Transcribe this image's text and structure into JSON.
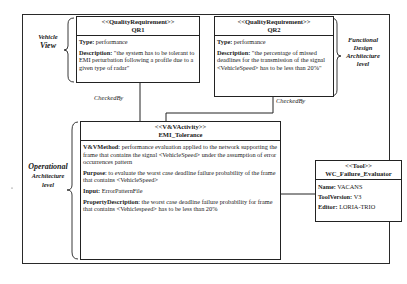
{
  "levels": {
    "vehicle": [
      "Vehicle",
      "View"
    ],
    "functional": [
      "Functional",
      "Design",
      "Architecture",
      "level"
    ],
    "operational": [
      "Operational",
      "Architecture",
      "level"
    ]
  },
  "qr1": {
    "stereotype": "<<QualityRequirement>>",
    "name": "QR1",
    "type_label": "Type:",
    "type_value": " performance",
    "desc_label": "Description:",
    "desc_value": " \"the system has to be tolerant to EMI perturbation following a profile due to a given type of radar\""
  },
  "qr2": {
    "stereotype": "<<QualityRequirement>>",
    "name": "QR2",
    "type_label": "Type:",
    "type_value": " performance",
    "desc_label": "Description:",
    "desc_value": " \"the percentage of missed deadlines for the transmission of the signal <VehicleSpeed> has to be less than 20%\""
  },
  "activity": {
    "stereotype": "<<V&VActivity>>",
    "name": "EMI_Tolerance",
    "method_label": "V&VMethod",
    "method_value": ": performance evaluation applied to the network supporting  the frame that contains the signal <VehicleSpeed>  under the assumption of error occurrences pattern",
    "purpose_label": "Purpose",
    "purpose_value": ": to evaluate the worst case deadline failure probability of the frame that contains <VehicleSpeed>",
    "input_label": "Input:",
    "input_value": " ErrorPatternFile",
    "prop_label": "PropertyDescription",
    "prop_value": ": the worst case deadline failure probability for frame that contains <Vehiclespeed> has to be less than 20%"
  },
  "tool": {
    "stereotype": "<<Tool>>",
    "name": "WC_Failure_Evaluator",
    "name_label": "Name:",
    "name_value": " VACANS",
    "version_label": "ToolVersion:",
    "version_value": " V3",
    "editor_label": "Editor:",
    "editor_value": " LORIA-TRIO"
  },
  "relations": {
    "checked_by_1": "CheckedBy",
    "checked_by_2": "CheckedBy",
    "supported_by": "SupportedBy"
  }
}
